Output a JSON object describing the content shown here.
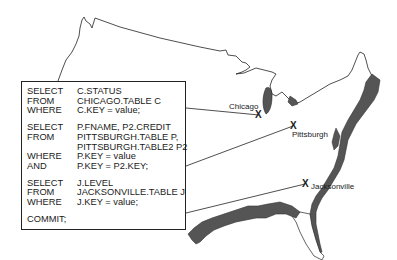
{
  "diagram": {
    "type": "distributed-database-map"
  },
  "sql_box": {
    "statements": [
      {
        "lines": [
          {
            "keyword": "SELECT",
            "argument": "C.STATUS"
          },
          {
            "keyword": "FROM",
            "argument": "CHICAGO.TABLE C"
          },
          {
            "keyword": "WHERE",
            "argument": "C.KEY = value;"
          }
        ]
      },
      {
        "lines": [
          {
            "keyword": "SELECT",
            "argument": "P.FNAME, P2.CREDIT"
          },
          {
            "keyword": "FROM",
            "argument": "PITTSBURGH.TABLE P,"
          },
          {
            "keyword": "",
            "argument": "PITTSBURGH.TABLE2 P2"
          },
          {
            "keyword": "WHERE",
            "argument": "P.KEY = value"
          },
          {
            "keyword": "AND",
            "argument": "P.KEY = P2.KEY;"
          }
        ]
      },
      {
        "lines": [
          {
            "keyword": "SELECT",
            "argument": "J.LEVEL"
          },
          {
            "keyword": "FROM",
            "argument": "JACKSONVILLE.TABLE J"
          },
          {
            "keyword": "WHERE",
            "argument": "J.KEY = value;"
          }
        ]
      },
      {
        "lines": [
          {
            "keyword": "COMMIT;",
            "argument": ""
          }
        ]
      }
    ]
  },
  "sites": [
    {
      "name": "Chicago",
      "marker": "X"
    },
    {
      "name": "Pittsburgh",
      "marker": "X"
    },
    {
      "name": "Jacksonville",
      "marker": "X"
    }
  ],
  "colors": {
    "outline": "#222222",
    "coast_fill": "#555555",
    "background": "#ffffff"
  }
}
